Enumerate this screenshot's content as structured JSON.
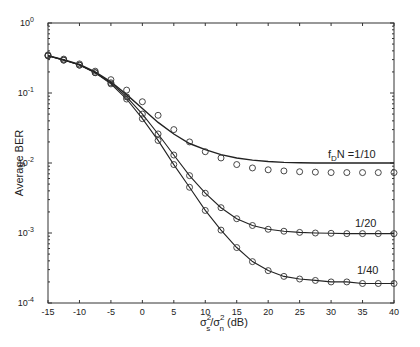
{
  "chart_data": {
    "type": "line",
    "title": "",
    "xlabel": "σs²/σn² (dB)",
    "xlabel_parts": {
      "sigma": "σ",
      "sub_s": "s",
      "sub_n": "n",
      "sup": "2",
      "slash": "/",
      "unit": "(dB)"
    },
    "ylabel": "Average BER",
    "xlim": [
      -15,
      40
    ],
    "ylim": [
      0.0001,
      1
    ],
    "yscale": "log",
    "grid": false,
    "xticks": [
      -15,
      -10,
      -5,
      0,
      5,
      10,
      15,
      20,
      25,
      30,
      35,
      40
    ],
    "xtick_labels": [
      "-15",
      "-10",
      "-5",
      "0",
      "5",
      "10",
      "15",
      "20",
      "25",
      "30",
      "35",
      "40"
    ],
    "yticks": [
      0.0001,
      0.001,
      0.01,
      0.1,
      1
    ],
    "ytick_exponents": [
      "-4",
      "-3",
      "-2",
      "-1",
      "0"
    ],
    "ytick_base": "10",
    "x": [
      -15,
      -12.5,
      -10,
      -7.5,
      -5,
      -2.5,
      0,
      2.5,
      5,
      7.5,
      10,
      12.5,
      15,
      17.5,
      20,
      22.5,
      25,
      27.5,
      30,
      32.5,
      35,
      37.5,
      40
    ],
    "series": [
      {
        "name": "fDN = 1/10 (analysis)",
        "label": "f_D N =1/10",
        "label_parts": {
          "f": "f",
          "sub": "D",
          "rest": "N =1/10"
        },
        "style": "line",
        "values": [
          0.34,
          0.3,
          0.255,
          0.2,
          0.145,
          0.095,
          0.06,
          0.038,
          0.026,
          0.019,
          0.0155,
          0.0132,
          0.0118,
          0.011,
          0.0105,
          0.0102,
          0.0101,
          0.01,
          0.01,
          0.01,
          0.01,
          0.01,
          0.01
        ]
      },
      {
        "name": "fDN = 1/10 (simulation)",
        "style": "markers",
        "values": [
          0.35,
          0.305,
          0.26,
          0.205,
          0.155,
          0.11,
          0.075,
          0.048,
          0.03,
          0.02,
          0.0145,
          0.0118,
          0.0095,
          0.0085,
          0.008,
          0.0077,
          0.0075,
          0.0074,
          0.0073,
          0.0073,
          0.0073,
          0.0073,
          0.0073
        ]
      },
      {
        "name": "fDN = 1/20",
        "label": "1/20",
        "style": "line+markers",
        "values": [
          0.34,
          0.295,
          0.25,
          0.195,
          0.14,
          0.088,
          0.05,
          0.026,
          0.013,
          0.0066,
          0.0037,
          0.0023,
          0.0016,
          0.00128,
          0.00113,
          0.00106,
          0.00102,
          0.001,
          0.00099,
          0.00098,
          0.00098,
          0.00098,
          0.00098
        ]
      },
      {
        "name": "fDN = 1/40",
        "label": "1/40",
        "style": "line+markers",
        "values": [
          0.34,
          0.295,
          0.25,
          0.195,
          0.135,
          0.082,
          0.043,
          0.021,
          0.0095,
          0.0045,
          0.0021,
          0.0011,
          0.00062,
          0.00039,
          0.00029,
          0.00024,
          0.00022,
          0.00021,
          0.0002,
          0.0002,
          0.00019,
          0.00019,
          0.00019
        ]
      }
    ]
  }
}
